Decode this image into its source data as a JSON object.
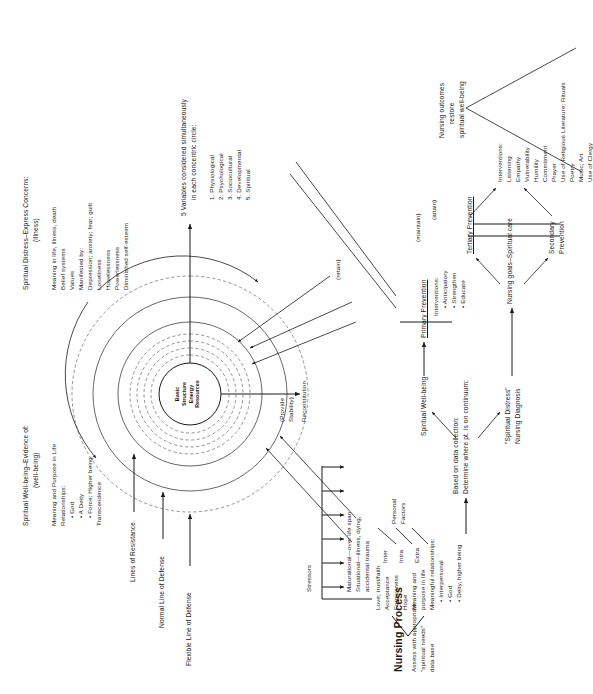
{
  "figure": {
    "title": "Nursing Process",
    "center_core": [
      "Basic",
      "Structure",
      "Energy",
      "Resources"
    ]
  },
  "ring_labels": {
    "flexible_line": "Flexible Line of Defense",
    "normal_line": "Normal Line of Defense",
    "lines_of_resistance": "Lines of Resistance"
  },
  "assessment": {
    "heading": "Assess with appropriate",
    "line2": "\"spiritual needs\"",
    "line3": "data base",
    "needs": [
      "Love; trust/faith",
      "Acceptance",
      "Forgiveness",
      "Hope",
      "Meaning and",
      "purpose in life",
      "Meaningful relationships:"
    ],
    "relationship_bullets": [
      "• Interpersonal",
      "• God",
      "• Deity, higher being"
    ]
  },
  "stressors": {
    "heading": "Stressors",
    "items": [
      "Maturational—over life span",
      "Situational—illness, dying,",
      "accidental trauma"
    ],
    "factor_types": [
      "Inter",
      "Intra",
      "Extra"
    ],
    "factor_label": [
      "Personal",
      "Factors"
    ]
  },
  "wellbeing": {
    "heading": "Spiritual Well-being–Evidence of:",
    "subheading": "(well-being)",
    "lines": [
      "Meaning and Purpose in Life",
      "Relationships:"
    ],
    "bullets": [
      "• God",
      "• A Deity",
      "• Force; Higher being"
    ],
    "last": "Transcendence"
  },
  "distress": {
    "heading": "Spiritual Distress–Express Concerns:",
    "subheading": "(illness)",
    "lines": [
      "Meaning in life, illness, death",
      "Belief systems",
      "Values",
      "Manifested by:",
      "Depression; anxiety; fear; guilt",
      "Loneliness",
      "Hopelessness",
      "Powerlessness",
      "Diminished self-esteem"
    ]
  },
  "variables": {
    "heading1": "5 Variables considered simultaneously",
    "heading2": "in each concentric circle:",
    "items": [
      "1. Physiological",
      "2. Psychological",
      "3. Sociocultural",
      "4. Developmental",
      "5. Spiritual"
    ]
  },
  "reconstitution": {
    "line1": "(Provide",
    "line2": "Stability)",
    "line3": "Reconstitution"
  },
  "diagnosis": {
    "based_on": "Based on data collection:",
    "determine": "Determine where pt. is on continuum:",
    "wellbeing_node": "Spiritual Well-being",
    "distress_node1": "\"Spiritual Distress\"",
    "distress_node2": "Nursing Diagnosis"
  },
  "prevention": {
    "primary": "Primary Prevention",
    "primary_interventions_heading": "Interventions:",
    "primary_interventions": [
      "• Anticipatory",
      "• Strengthen",
      "• Educate"
    ],
    "retain": "(retain)",
    "maintain": "(maintain)",
    "attain": "(attain)",
    "goals": "Nursing goals–Spiritual care",
    "secondary1": "Secondary",
    "secondary2": "Prevention",
    "tertiary": "Tertiary Prevention"
  },
  "interventions": {
    "heading": "Interventions:",
    "items": [
      "Listening",
      "Empathy",
      "Vulnerability",
      "Humility",
      "Commitment",
      "Prayer",
      "Use of Religious Literature; Rituals",
      "Poetry",
      "Music; Art",
      "Use of Clergy"
    ]
  },
  "outcomes": {
    "line1": "Nursing outcomes",
    "line2": "restore",
    "line3": "spiritual well-being"
  }
}
